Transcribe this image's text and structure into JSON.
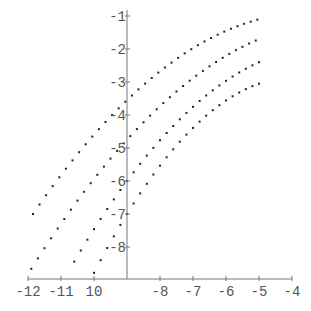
{
  "chart_data": {
    "type": "scatter",
    "title": "",
    "xlabel": "",
    "ylabel": "",
    "xlim": [
      -12,
      -4
    ],
    "ylim": [
      -9,
      -1
    ],
    "grid": false,
    "legend": "none",
    "axes_origin": {
      "x": -9,
      "y": -9
    },
    "x_ticks": [
      -12,
      -11,
      -10,
      -8,
      -7,
      -6,
      -5,
      -4
    ],
    "x_tick_labels": [
      "-12",
      "-11",
      "10",
      "-8",
      "-7",
      "-6",
      "-5",
      "-4"
    ],
    "y_ticks": [
      -1,
      -2,
      -3,
      -4,
      -5,
      -6,
      -7,
      -8
    ],
    "y_tick_labels": [
      "-1",
      "-2",
      "-3",
      "-4",
      "-5",
      "-6",
      "-7",
      "-8"
    ],
    "point_step": 0.2,
    "series": [
      {
        "name": "series 1",
        "x_range": [
          -11.85,
          -5
        ],
        "coef": [
          -0.0873,
          0.9617,
          -3.55
        ],
        "points": [
          [
            -11.85,
            -7.0
          ],
          [
            -11.5,
            -6.5
          ],
          [
            -11,
            -5.8
          ],
          [
            -10.5,
            -5.19
          ],
          [
            -10,
            -4.6
          ],
          [
            -9.5,
            -4.05
          ],
          [
            -9,
            -3.55
          ],
          [
            -8.5,
            -3.09
          ],
          [
            -8,
            -2.68
          ],
          [
            -7.5,
            -2.31
          ],
          [
            -7,
            -1.98
          ],
          [
            -6.5,
            -1.7
          ],
          [
            -6,
            -1.45
          ],
          [
            -5.5,
            -1.25
          ],
          [
            -5,
            -1.1
          ]
        ]
      },
      {
        "name": "series 2",
        "x_range": [
          -11.9,
          -5
        ],
        "coef": [
          -0.085,
          1.1025,
          -4.75
        ],
        "points": [
          [
            -11.9,
            -8.3
          ],
          [
            -11.5,
            -7.7
          ],
          [
            -11,
            -6.95
          ],
          [
            -10.5,
            -6.2
          ],
          [
            -10,
            -5.48
          ],
          [
            -9.5,
            -4.82
          ],
          [
            -9,
            -4.75
          ],
          [
            -8.5,
            -4.2
          ],
          [
            -8,
            -3.73
          ],
          [
            -7.5,
            -3.3
          ],
          [
            -7,
            -2.89
          ],
          [
            -6.5,
            -2.52
          ],
          [
            -6,
            -2.18
          ],
          [
            -5.5,
            -1.9
          ],
          [
            -5,
            -1.7
          ]
        ]
      },
      {
        "name": "series 3",
        "x_range": [
          -10.6,
          -5
        ],
        "coef": [
          -0.1119,
          1.3475,
          -6.0
        ],
        "points": [
          [
            -10.6,
            -8.8
          ],
          [
            -10,
            -7.46
          ],
          [
            -9.5,
            -6.7
          ],
          [
            -9,
            -6.0
          ],
          [
            -8.5,
            -5.35
          ],
          [
            -8,
            -4.76
          ],
          [
            -7.5,
            -4.23
          ],
          [
            -7,
            -3.75
          ],
          [
            -6.5,
            -3.33
          ],
          [
            -6,
            -2.96
          ],
          [
            -5.5,
            -2.65
          ],
          [
            -5,
            -2.4
          ]
        ]
      },
      {
        "name": "series 4",
        "x_range": [
          -10.0,
          -5
        ],
        "coef": [
          -0.1588,
          1.6225,
          -7.0
        ],
        "points": [
          [
            -10,
            -8.8
          ],
          [
            -9.5,
            -7.85
          ],
          [
            -9,
            -7.0
          ],
          [
            -8.5,
            -6.23
          ],
          [
            -8,
            -5.54
          ],
          [
            -7.5,
            -4.92
          ],
          [
            -7,
            -4.39
          ],
          [
            -6.5,
            -3.93
          ],
          [
            -6,
            -3.56
          ],
          [
            -5.5,
            -3.23
          ],
          [
            -5,
            -2.95
          ]
        ]
      }
    ]
  },
  "style": {
    "axis_color": "#777777",
    "point_color": "#222222",
    "label_color": "#555555",
    "background": "#ffffff"
  }
}
